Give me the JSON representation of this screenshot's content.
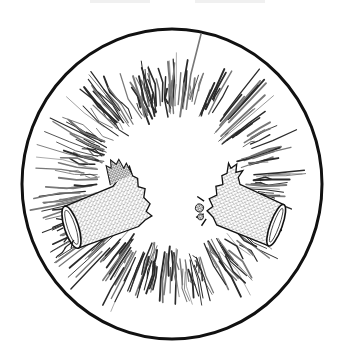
{
  "illustration": {
    "subject": "exploding firecracker",
    "style": "black-and-white pen-and-ink hatching with stipple shading",
    "frame": {
      "shape": "circle",
      "center": [
        172,
        184
      ],
      "radius_x": 150,
      "radius_y": 155,
      "stroke_color": "#111111",
      "stroke_width": 3
    },
    "burst": {
      "type": "radial jagged hatched rays",
      "inner_radius": 60,
      "outer_radius": 140,
      "ray_color": "#2a2a2a",
      "light_ray_color": "#777777",
      "ray_count": 46
    },
    "fragments": [
      {
        "name": "left-firecracker-half",
        "position": [
          100,
          218
        ],
        "angle_deg": -18,
        "fill": "stipple",
        "torn_edge": "right"
      },
      {
        "name": "right-firecracker-half",
        "position": [
          248,
          215
        ],
        "angle_deg": 20,
        "fill": "stipple",
        "torn_edge": "left"
      }
    ],
    "fuse": {
      "attached_to": "left-firecracker-half",
      "color": "#222222"
    },
    "colors": {
      "background": "#ffffff",
      "ink": "#111111"
    }
  }
}
